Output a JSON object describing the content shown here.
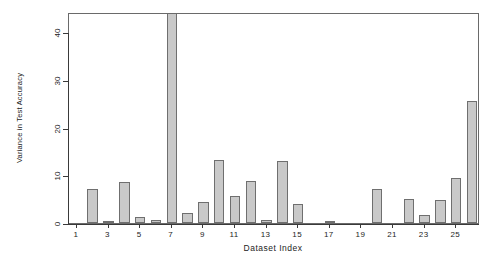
{
  "chart_data": {
    "type": "bar",
    "title": "",
    "xlabel": "Dataset Index",
    "ylabel": "Variance in Test Accuracy",
    "categories": [
      1,
      2,
      3,
      4,
      5,
      6,
      7,
      8,
      9,
      10,
      11,
      12,
      13,
      14,
      15,
      16,
      17,
      18,
      19,
      20,
      21,
      22,
      23,
      24,
      25,
      26
    ],
    "values": [
      0,
      7.2,
      0.4,
      8.5,
      1.3,
      0.6,
      45.5,
      2.2,
      4.4,
      13.1,
      5.7,
      8.7,
      0.7,
      12.9,
      3.9,
      0,
      0.5,
      0,
      0,
      7.2,
      0,
      5.0,
      1.6,
      4.9,
      9.4,
      25.6
    ],
    "xtick_values": [
      1,
      3,
      5,
      7,
      9,
      11,
      13,
      15,
      17,
      19,
      21,
      23,
      25
    ],
    "xtick_labels": [
      "1",
      "3",
      "5",
      "7",
      "9",
      "11",
      "13",
      "15",
      "17",
      "19",
      "21",
      "23",
      "25"
    ],
    "ytick_values": [
      0,
      10,
      20,
      30,
      40
    ],
    "ytick_labels": [
      "0",
      "10",
      "20",
      "30",
      "40"
    ],
    "ylim": [
      0,
      44.3
    ],
    "xlim": [
      0.4,
      26.6
    ],
    "grid": false,
    "legend": null,
    "bar_fill_color": "#c9c9c9",
    "bar_border_color": "#6f6f6f",
    "axis_color": "#3a3a3a",
    "background_color": "#ffffff"
  }
}
